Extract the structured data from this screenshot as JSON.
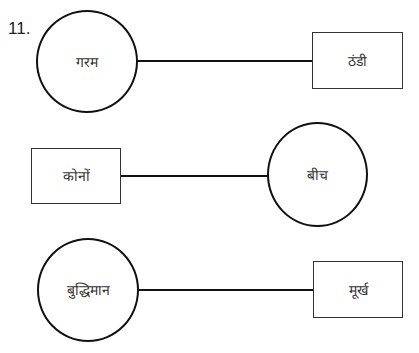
{
  "question": {
    "number": "11."
  },
  "pairs": [
    {
      "left": {
        "shape": "circle",
        "text": "गरम"
      },
      "right": {
        "shape": "box",
        "text": "ठंडी"
      }
    },
    {
      "left": {
        "shape": "box",
        "text": "कोनों"
      },
      "right": {
        "shape": "circle",
        "text": "बीच"
      }
    },
    {
      "left": {
        "shape": "circle",
        "text": "बुद्धिमान"
      },
      "right": {
        "shape": "box",
        "text": "मूर्ख"
      }
    }
  ],
  "colors": {
    "stroke": "#111111",
    "box_border": "#333333",
    "text": "#333333",
    "background": "#ffffff"
  }
}
